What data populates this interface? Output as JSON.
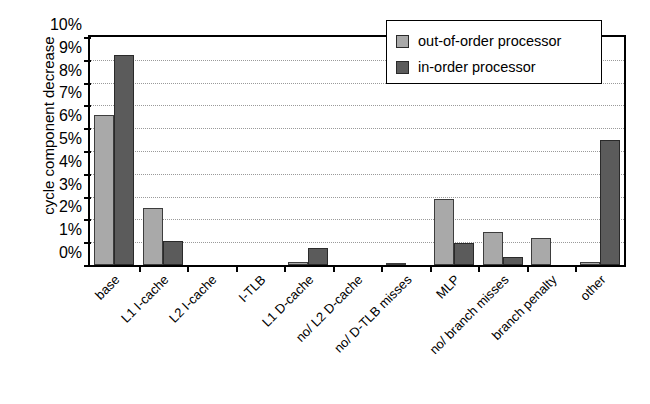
{
  "chart_data": {
    "type": "bar",
    "title": "",
    "xlabel": "",
    "ylabel": "cycle component decrease",
    "ylim": [
      0,
      10
    ],
    "ytick_labels": [
      "0%",
      "1%",
      "2%",
      "3%",
      "4%",
      "5%",
      "6%",
      "7%",
      "8%",
      "9%",
      "10%"
    ],
    "ytick_values": [
      0,
      1,
      2,
      3,
      4,
      5,
      6,
      7,
      8,
      9,
      10
    ],
    "grid": true,
    "legend_position": "top-right",
    "categories": [
      "base",
      "L1 I-cache",
      "L2 I-cache",
      "I-TLB",
      "L1 D-cache",
      "no/ L2 D-cache",
      "no/ D-TLB misses",
      "MLP",
      "no/ branch misses",
      "branch penalty",
      "other"
    ],
    "series": [
      {
        "name": "out-of-order processor",
        "color": "#a9a9a9",
        "values": [
          6.6,
          2.5,
          0.0,
          0.0,
          0.15,
          0.0,
          0.1,
          2.9,
          1.45,
          1.2,
          0.15
        ]
      },
      {
        "name": "in-order processor",
        "color": "#5b5b5b",
        "values": [
          9.2,
          1.05,
          0.0,
          0.0,
          0.75,
          0.0,
          0.0,
          0.95,
          0.35,
          0.0,
          5.5
        ]
      }
    ]
  },
  "legend": {
    "items": [
      {
        "label": "out-of-order processor",
        "swatch": "series-0-swatch"
      },
      {
        "label": "in-order processor",
        "swatch": "series-1-swatch"
      }
    ]
  }
}
